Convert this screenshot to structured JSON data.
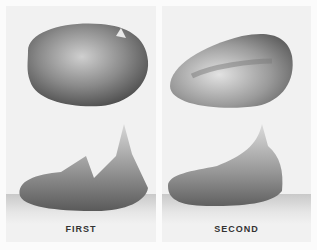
{
  "illustration": {
    "panels": [
      {
        "label": "FIRST",
        "description": "top view and side view of first object"
      },
      {
        "label": "SECOND",
        "description": "top view and side view of second object"
      }
    ],
    "colors": {
      "background": "#f1f1f1",
      "shade_dark": "#555555",
      "shade_light": "#e0e0e0"
    }
  }
}
